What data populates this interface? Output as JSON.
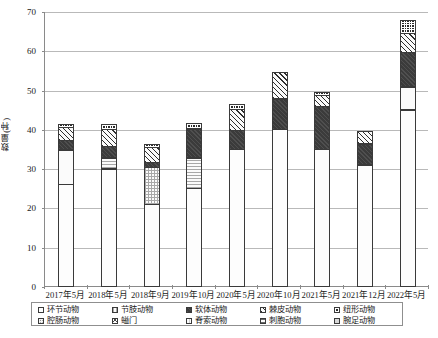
{
  "chart_data": {
    "type": "bar",
    "stacked": true,
    "title": "",
    "xlabel": "",
    "ylabel": "数量(种)",
    "ylim": [
      0,
      70
    ],
    "ytick_step": 10,
    "yticks": [
      "0",
      "10",
      "20",
      "30",
      "40",
      "50",
      "60",
      "70"
    ],
    "grid": true,
    "legend_position": "bottom",
    "categories": [
      "2017年5月",
      "2018年5月",
      "2018年9月",
      "2019年10月",
      "2020年5月",
      "2020年10月",
      "2021年5月",
      "2021年12月",
      "2022年5月"
    ],
    "series": [
      {
        "name": "环节动物",
        "pattern": "p-blank",
        "values": [
          26,
          30,
          21,
          25,
          35,
          40,
          35,
          31,
          45
        ]
      },
      {
        "name": "节肢动物",
        "pattern": "p-grid",
        "values": [
          9,
          3,
          9.5,
          8,
          0,
          0,
          0,
          0,
          6
        ]
      },
      {
        "name": "软体动物",
        "pattern": "p-dark",
        "values": [
          2.5,
          3,
          1.5,
          7.5,
          5,
          8,
          11,
          5.5,
          9
        ]
      },
      {
        "name": "棘皮动物",
        "pattern": "p-hatch",
        "values": [
          3.5,
          4.5,
          4,
          0,
          5.5,
          7,
          3,
          3.5,
          5
        ]
      },
      {
        "name": "纽形动物",
        "pattern": "p-check",
        "values": [
          1,
          1.5,
          1,
          1.5,
          1.5,
          0,
          1,
          0,
          3.5
        ]
      },
      {
        "name": "腔肠动物",
        "pattern": "p-dots",
        "values": [
          0,
          0,
          0,
          0,
          0,
          0,
          0,
          0,
          0
        ]
      },
      {
        "name": "螠门",
        "pattern": "p-cross",
        "values": [
          0,
          0,
          0,
          0,
          0,
          0,
          0,
          0,
          0
        ]
      },
      {
        "name": "脊索动物",
        "pattern": "p-vthin",
        "values": [
          0,
          0,
          0,
          0,
          0,
          0,
          0,
          0,
          0
        ]
      },
      {
        "name": "刺胞动物",
        "pattern": "p-hdash",
        "values": [
          0,
          0,
          0,
          0,
          0,
          0,
          0,
          0,
          0
        ]
      },
      {
        "name": "腕足动物",
        "pattern": "p-lgray",
        "values": [
          0,
          0,
          0,
          0,
          0,
          0,
          0,
          0,
          0
        ]
      }
    ],
    "totals": [
      42,
      42,
      37,
      42,
      47,
      55,
      50,
      40,
      68.5
    ]
  },
  "legend": {
    "row1": [
      {
        "label": "环节动物",
        "pattern": "p-blank"
      },
      {
        "label": "节肢动物",
        "pattern": "p-grid"
      },
      {
        "label": "软体动物",
        "pattern": "p-dark"
      },
      {
        "label": "棘皮动物",
        "pattern": "p-hatch"
      },
      {
        "label": "纽形动物",
        "pattern": "p-check"
      }
    ],
    "row2": [
      {
        "label": "腔肠动物",
        "pattern": "p-dots"
      },
      {
        "label": "螠门",
        "pattern": "p-cross"
      },
      {
        "label": "脊索动物",
        "pattern": "p-vthin"
      },
      {
        "label": "刺胞动物",
        "pattern": "p-hdash"
      },
      {
        "label": "腕足动物",
        "pattern": "p-lgray"
      }
    ]
  }
}
